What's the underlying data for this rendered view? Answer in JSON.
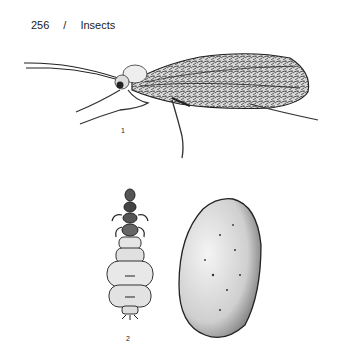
{
  "page": {
    "number": "256",
    "separator": "/",
    "section": "Insects"
  },
  "figures": [
    {
      "label": "1",
      "subject": "adult-winged-insect-illustration"
    },
    {
      "label": "2",
      "subject": "larva-illustration"
    },
    {
      "label": "",
      "subject": "egg-or-pupa-case-illustration"
    }
  ]
}
